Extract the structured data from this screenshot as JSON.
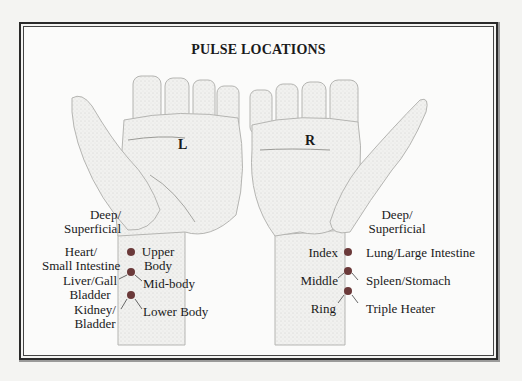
{
  "title": "PULSE LOCATIONS",
  "colors": {
    "frame": "#2a2a2a",
    "background": "#fbfbfa",
    "pulse_dot": "#6b3a3a",
    "skin_shading": "#d8d8d6"
  },
  "left_hand": {
    "letter": "L",
    "depth_label": "Deep/\nSuperficial",
    "depth_line1": "Deep/",
    "depth_line2": "Superficial",
    "points": [
      {
        "organ_line1": "Heart/",
        "organ_line2": "Small Intestine",
        "region_line1": "Upper",
        "region_line2": "Body"
      },
      {
        "organ_line1": "Liver/Gall",
        "organ_line2": "Bladder",
        "region_line1": "Mid-body",
        "region_line2": ""
      },
      {
        "organ_line1": "Kidney/",
        "organ_line2": "Bladder",
        "region_line1": "Lower Body",
        "region_line2": ""
      }
    ]
  },
  "right_hand": {
    "letter": "R",
    "depth_line1": "Deep/",
    "depth_line2": "Superficial",
    "points": [
      {
        "finger": "Index",
        "organ": "Lung/Large Intestine"
      },
      {
        "finger": "Middle",
        "organ": "Spleen/Stomach"
      },
      {
        "finger": "Ring",
        "organ": "Triple Heater"
      }
    ]
  }
}
